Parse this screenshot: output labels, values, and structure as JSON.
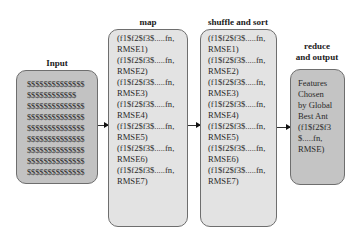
{
  "diagram": {
    "input": {
      "title": "Input",
      "lines": [
        "$$$$$$$$$$$$$$",
        "$$$$$$$$$$$$",
        "$$$$$$$$$$$$$$",
        "$$$$$$$$$$$$$$",
        "$$$$$$$$$$$$$$",
        "$$$$$$$$$$$$$$",
        "$$$$$$$$$$$$$$",
        "$$$$$$$$$$$$$$",
        "$$$$$$$$$$$$$$"
      ]
    },
    "map": {
      "title": "map",
      "lines": [
        "(f1$f2$f3$.....fn,",
        "RMSE1)",
        "(f1$f2$f3$.....fn,",
        "RMSE2)",
        "(f1$f2$f3$.....fn,",
        "RMSE3)",
        "(f1$f2$f3$.....fn,",
        "RMSE4)",
        "(f1$f2$f3$.....fn,",
        "RMSE5)",
        "(f1$f2$f3$.....fn,",
        "RMSE6)",
        "(f1$f2$f3$.....fn,",
        "RMSE7)"
      ]
    },
    "shuffle": {
      "title": "shuffle and sort",
      "lines": [
        "(f1$f2$f3$.....fn,",
        "RMSE1)",
        "(f1$f2$f3$.....fn,",
        "RMSE2)",
        "(f1$f2$f3$.....fn,",
        "RMSE3)",
        "(f1$f2$f3$.....fn,",
        "RMSE4)",
        "(f1$f2$f3$.....fn,",
        "RMSE5)",
        "(f1$f2$f3$.....fn,",
        "RMSE6)",
        "(f1$f2$f3$.....fn,",
        "RMSE7)"
      ]
    },
    "reduce": {
      "title_line1": "reduce",
      "title_line2": "and output",
      "lines": [
        "Features",
        "Chosen",
        "by  Global",
        "Best Ant",
        "(f1$f2$f3",
        "$.....fn,",
        "RMSE)"
      ]
    },
    "colors": {
      "input_fill": "#c2c2c2",
      "map_fill": "#e3e3e3",
      "shuffle_fill": "#e3e3e3",
      "reduce_fill": "#c4c4c4",
      "border": "#6e6e6e"
    }
  }
}
